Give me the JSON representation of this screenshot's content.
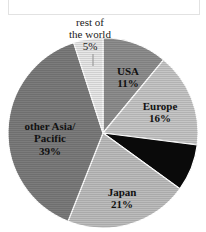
{
  "chart_data": {
    "type": "pie",
    "title": "",
    "subtitle": "",
    "xlabel": "",
    "ylabel": "",
    "legend_position": "none",
    "grid": false,
    "unit": "%",
    "categories": [
      "USA",
      "Europe",
      "unlabeled",
      "Japan",
      "other Asia/Pacific",
      "rest of the world"
    ],
    "values": [
      11,
      16,
      8,
      21,
      39,
      5
    ],
    "slices": [
      {
        "id": "usa",
        "label": "USA",
        "value": 11,
        "value_text": "11%",
        "color": "#8e8e8e",
        "pattern": "horizontal-hatch",
        "label_placement": "inside",
        "label_x": 128,
        "label_y": 75,
        "pct_x": 128,
        "pct_y": 87
      },
      {
        "id": "europe",
        "label": "Europe",
        "value": 16,
        "value_text": "16%",
        "color": "#c6c6c6",
        "pattern": "horizontal-hatch",
        "label_placement": "inside",
        "label_x": 160,
        "label_y": 110,
        "pct_x": 160,
        "pct_y": 122
      },
      {
        "id": "unlabeled-black",
        "label": "",
        "value": 8,
        "value_text": "",
        "color": "#0a0a0a",
        "pattern": "solid",
        "label_placement": "none",
        "label_x": 0,
        "label_y": 0,
        "pct_x": 0,
        "pct_y": 0
      },
      {
        "id": "japan",
        "label": "Japan",
        "value": 21,
        "value_text": "21%",
        "color": "#bdbdbd",
        "pattern": "horizontal-hatch",
        "label_placement": "inside",
        "label_x": 122,
        "label_y": 196,
        "pct_x": 122,
        "pct_y": 208
      },
      {
        "id": "other-asia-pacific",
        "label": "other Asia/",
        "label_line2": "Pacific",
        "value": 39,
        "value_text": "39%",
        "color": "#7c7c7c",
        "pattern": "horizontal-hatch",
        "label_placement": "inside",
        "label_x": 50,
        "label_y": 130,
        "label_line2_x": 50,
        "label_line2_y": 142,
        "pct_x": 50,
        "pct_y": 155
      },
      {
        "id": "rest-of-the-world",
        "label": "rest of",
        "label_line2": "the world",
        "value": 5,
        "value_text": "5%",
        "color": "#e8e8e8",
        "pattern": "horizontal-hatch",
        "label_placement": "outside",
        "label_x": 90,
        "label_y": 26,
        "label_line2_x": 90,
        "label_line2_y": 38,
        "pct_x": 90,
        "pct_y": 50
      }
    ],
    "geometry": {
      "center_x": 103,
      "center_y": 133,
      "radius": 95,
      "start_angle_deg": -90,
      "direction": "clockwise"
    },
    "colors": {
      "background": "#ffffff",
      "outline": "#ffffff",
      "text": "#111111",
      "leader_line": "#909090",
      "frame": "#e2e2e2"
    }
  }
}
